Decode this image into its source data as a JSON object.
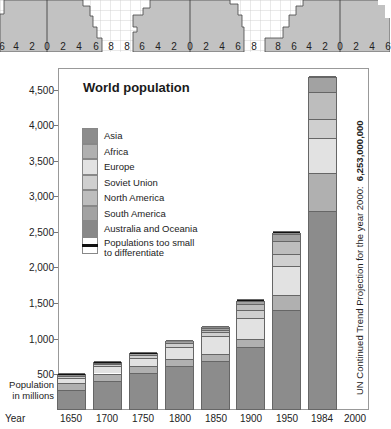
{
  "chart_data": {
    "type": "bar",
    "stacked": true,
    "title": "World population",
    "xlabel": "Year",
    "ylabel": "Population in millions",
    "ylim": [
      0,
      4800
    ],
    "yticks": [
      500,
      1000,
      1500,
      2000,
      2500,
      3000,
      3500,
      4000,
      4500
    ],
    "ytick_labels": [
      "500",
      "1,000",
      "1,500",
      "2,000",
      "2,500",
      "3,000",
      "3,500",
      "4,000",
      "4,500"
    ],
    "categories": [
      "1650",
      "1700",
      "1750",
      "1800",
      "1850",
      "1900",
      "1950",
      "1984",
      "2000"
    ],
    "legend": [
      "Asia",
      "Africa",
      "Europe",
      "Soviet Union",
      "North America",
      "South America",
      "Australia and Oceania",
      "Populations too small to differentiate"
    ],
    "legend_position": "upper-left inside",
    "grid": false,
    "series": [
      {
        "name": "Asia",
        "color": "#8c8c8c",
        "values": [
          270,
          400,
          500,
          610,
          680,
          870,
          1390,
          2790,
          null
        ]
      },
      {
        "name": "Africa",
        "color": "#b0b0b0",
        "values": [
          100,
          100,
          100,
          100,
          100,
          120,
          220,
          540,
          null
        ]
      },
      {
        "name": "Europe",
        "color": "#e2e2e2",
        "values": [
          60,
          100,
          120,
          170,
          250,
          290,
          400,
          490,
          null
        ]
      },
      {
        "name": "Soviet Union",
        "color": "#cfcfcf",
        "values": [
          30,
          30,
          40,
          50,
          60,
          120,
          180,
          270,
          null
        ]
      },
      {
        "name": "North America",
        "color": "#bdbdbd",
        "values": [
          1,
          2,
          2,
          5,
          25,
          80,
          170,
          380,
          null
        ]
      },
      {
        "name": "South America",
        "color": "#a2a2a2",
        "values": [
          10,
          10,
          10,
          15,
          30,
          40,
          110,
          200,
          null
        ]
      },
      {
        "name": "Australia and Oceania",
        "color": "#888888",
        "values": [
          2,
          2,
          2,
          2,
          5,
          6,
          13,
          25,
          null
        ]
      },
      {
        "name": "Populations too small to differentiate",
        "color": "#111111",
        "values": [
          40,
          35,
          30,
          25,
          20,
          10,
          5,
          0,
          null
        ]
      }
    ],
    "totals_approx": [
      500,
      630,
      770,
      980,
      1150,
      1570,
      2530,
      4740,
      null
    ],
    "annotation": "UN Continued Trend Projection for the year 2000: 6,253,000,000"
  },
  "pyramid_strip": {
    "tick_labels": [
      "6",
      "4",
      "2",
      "0",
      "2",
      "4",
      "6",
      "8",
      "8",
      "6",
      "4",
      "2",
      "0",
      "2",
      "4",
      "6",
      "8",
      "8",
      "6",
      "4",
      "2",
      "0",
      "2",
      "4",
      "6"
    ]
  },
  "legend_labels": {
    "asia": "Asia",
    "africa": "Africa",
    "europe": "Europe",
    "soviet": "Soviet Union",
    "namerica": "North America",
    "samerica": "South America",
    "oceania": "Australia and Oceania",
    "small_1": "Populations too small",
    "small_2": "to differentiate"
  },
  "axis": {
    "year_label": "Year",
    "ylabel_1": "Population",
    "ylabel_2": "in millions"
  },
  "note": {
    "text": "UN Continued Trend Projection for the year 2000:",
    "value": "6,253,000,000"
  }
}
